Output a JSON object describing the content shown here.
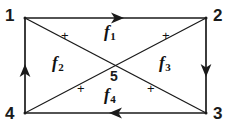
{
  "figure": {
    "background_color": "#ffffff",
    "line_color": "#1a1a1a",
    "text_color": "#111111",
    "width": 233,
    "height": 129
  },
  "vertices": [
    {
      "id": "v1",
      "label": "1",
      "x": 24,
      "y": 15,
      "node_x": 25,
      "node_y": 18,
      "corner": "top-left"
    },
    {
      "id": "v2",
      "label": "2",
      "x": 206,
      "y": 15,
      "node_x": 206,
      "node_y": 18,
      "corner": "top-right"
    },
    {
      "id": "v3",
      "label": "3",
      "x": 206,
      "y": 112,
      "node_x": 206,
      "node_y": 113,
      "corner": "bottom-right"
    },
    {
      "id": "v4",
      "label": "4",
      "x": 24,
      "y": 112,
      "node_x": 25,
      "node_y": 113,
      "corner": "bottom-left"
    },
    {
      "id": "v5",
      "label": "5",
      "x": 115,
      "y": 76,
      "node_x": 116,
      "node_y": 66,
      "corner": "center"
    }
  ],
  "faces": [
    {
      "id": "f1",
      "label": "f",
      "subscript": "1",
      "x": 104,
      "y": 26,
      "sign": "+",
      "sign_x": 62,
      "sign_y": 36,
      "position": "top"
    },
    {
      "id": "f2",
      "label": "f",
      "subscript": "2",
      "x": 54,
      "y": 57,
      "sign": "+",
      "sign_x": 62,
      "sign_y": 36,
      "position": "left"
    },
    {
      "id": "f3",
      "label": "f",
      "subscript": "3",
      "x": 160,
      "y": 57,
      "sign": "+",
      "sign_x": 166,
      "sign_y": 36,
      "position": "right"
    },
    {
      "id": "f4",
      "label": "f",
      "subscript": "4",
      "x": 104,
      "y": 89,
      "sign": "+",
      "sign_x": 78,
      "sign_y": 90,
      "position": "bottom"
    }
  ],
  "signs": [
    {
      "id": "sign-f2",
      "text": "+",
      "x": 62,
      "y": 35
    },
    {
      "id": "sign-f3",
      "text": "+",
      "x": 163,
      "y": 35
    },
    {
      "id": "sign-f4-left",
      "text": "+",
      "x": 78,
      "y": 88
    },
    {
      "id": "sign-f4-right",
      "text": "+",
      "x": 148,
      "y": 88
    }
  ],
  "edges": [
    {
      "id": "edge-1-2",
      "from": "1",
      "to": "2",
      "directed": true,
      "direction": "right",
      "kind": "boundary"
    },
    {
      "id": "edge-2-3",
      "from": "2",
      "to": "3",
      "directed": true,
      "direction": "down",
      "kind": "boundary"
    },
    {
      "id": "edge-3-4",
      "from": "3",
      "to": "4",
      "directed": true,
      "direction": "left",
      "kind": "boundary"
    },
    {
      "id": "edge-4-1",
      "from": "4",
      "to": "1",
      "directed": true,
      "direction": "up",
      "kind": "boundary"
    },
    {
      "id": "edge-1-3",
      "from": "1",
      "to": "3",
      "directed": false,
      "direction": "none",
      "kind": "diagonal"
    },
    {
      "id": "edge-4-2",
      "from": "4",
      "to": "2",
      "directed": false,
      "direction": "none",
      "kind": "diagonal"
    }
  ]
}
